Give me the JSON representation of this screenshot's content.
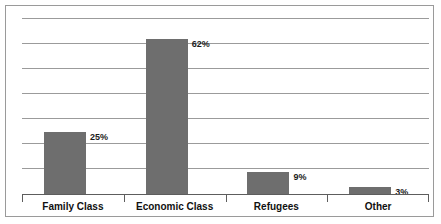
{
  "chart_data": {
    "type": "bar",
    "title": "",
    "subtitle": "",
    "xlabel": "",
    "ylabel": "",
    "categories": [
      "Family Class",
      "Economic Class",
      "Refugees",
      "Other"
    ],
    "values": [
      25,
      62,
      9,
      3
    ],
    "value_labels": [
      "25%",
      "62%",
      "9%",
      "3%"
    ],
    "ylim": [
      0,
      70
    ],
    "grid": true,
    "gridlines": [
      10,
      20,
      30,
      40,
      50,
      60,
      70
    ],
    "legend": "none",
    "axis_tick_labels": [],
    "colors": {
      "bar_fill": "#6e6e6e",
      "gridline": "#9b9b9b",
      "axis_line": "#5d5d5d",
      "frame_border": "#9a9a9a",
      "background": "#ffffff",
      "label_text": "#111111"
    }
  }
}
